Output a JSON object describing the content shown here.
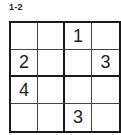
{
  "puzzle": {
    "title": "1-2",
    "size": 4,
    "cells": [
      [
        "",
        "",
        "1",
        ""
      ],
      [
        "2",
        "",
        "",
        "3"
      ],
      [
        "4",
        "",
        "",
        ""
      ],
      [
        "",
        "",
        "3",
        ""
      ]
    ]
  }
}
